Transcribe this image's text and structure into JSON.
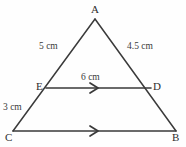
{
  "figure": {
    "type": "geometry-diagram",
    "background_color": "#fefefe",
    "stroke_color": "#3a3a3a",
    "text_color": "#3a3a3a"
  },
  "vertices": {
    "A": {
      "label": "A",
      "x": 95,
      "y": 19
    },
    "B": {
      "label": "B",
      "x": 176,
      "y": 131
    },
    "C": {
      "label": "C",
      "x": 13,
      "y": 131
    },
    "D": {
      "label": "D",
      "x": 151,
      "y": 88
    },
    "E": {
      "label": "E",
      "x": 46,
      "y": 88
    }
  },
  "measurements": {
    "AE": "5 cm",
    "AD": "4.5 cm",
    "ED": "6 cm",
    "EC": "3 cm"
  },
  "segments": [
    {
      "name": "AC",
      "from": "A",
      "to": "C",
      "parallel_mark": false
    },
    {
      "name": "AB",
      "from": "A",
      "to": "B",
      "parallel_mark": false
    },
    {
      "name": "ED",
      "from": "E",
      "to": "D",
      "parallel_mark": true
    },
    {
      "name": "CB",
      "from": "C",
      "to": "B",
      "parallel_mark": true
    }
  ],
  "markers": {
    "arrow_ED": {
      "name": "single-chevron-right",
      "x": 95,
      "y": 88
    },
    "arrow_CB": {
      "name": "single-chevron-right",
      "x": 95,
      "y": 131
    }
  }
}
